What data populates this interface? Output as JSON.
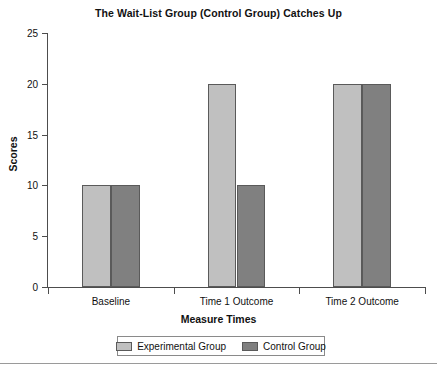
{
  "chart_data": {
    "type": "bar",
    "title": "The Wait-List Group (Control Group) Catches Up",
    "xlabel": "Measure Times",
    "ylabel": "Scores",
    "categories": [
      "Baseline",
      "Time 1 Outcome",
      "Time 2 Outcome"
    ],
    "series": [
      {
        "name": "Experimental Group",
        "color": "#c0c0c0",
        "values": [
          10,
          20,
          20
        ]
      },
      {
        "name": "Control Group",
        "color": "#808080",
        "values": [
          10,
          10,
          20
        ]
      }
    ],
    "ylim": [
      0,
      25
    ],
    "yticks": [
      0,
      5,
      10,
      15,
      20,
      25
    ],
    "ytick_labels": [
      "0",
      "5",
      "10",
      "15",
      "20",
      "25"
    ],
    "grid": false,
    "legend_position": "bottom"
  },
  "legend": {
    "entries": [
      {
        "label": "Experimental Group"
      },
      {
        "label": "Control Group"
      }
    ]
  }
}
